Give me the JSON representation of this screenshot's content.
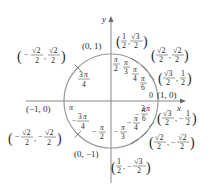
{
  "diagram": {
    "axes": {
      "x_label": "x",
      "y_label": "y"
    },
    "colors": {
      "circle": "#9a9a9a",
      "axes": "#6a6a6a",
      "text": "#2a2a2a"
    },
    "points": [
      {
        "id": "p0",
        "angle_label": "0",
        "alt_label": "2π",
        "coords": "(1, 0)"
      },
      {
        "id": "p30",
        "angle_label": "π/6",
        "coords": "(√3/2, 1/2)"
      },
      {
        "id": "p45",
        "angle_label": "π/4",
        "coords": "(√2/2, √2/2)"
      },
      {
        "id": "p60",
        "angle_label": "π/3",
        "coords": "(1/2, √3/2)"
      },
      {
        "id": "p90",
        "angle_label": "π/2",
        "coords": "(0, 1)"
      },
      {
        "id": "p135",
        "angle_label": "3π/4",
        "coords": "(−√2/2, √2/2)"
      },
      {
        "id": "p180",
        "angle_label": "π",
        "coords": "(−1, 0)"
      },
      {
        "id": "p225",
        "angle_label": "−3π/4",
        "coords": "(−√2/2, −√2/2)"
      },
      {
        "id": "p270",
        "angle_label": "−π/2",
        "coords": "(0, −1)"
      },
      {
        "id": "p300",
        "angle_label": "−π/3",
        "coords": "(1/2, −√3/2)"
      },
      {
        "id": "p315",
        "angle_label": "−π/4",
        "coords": "(√2/2, −√2/2)"
      },
      {
        "id": "p330",
        "angle_label": "−π/6",
        "coords": "(√3/2, −1/2)"
      }
    ],
    "labels": {
      "one_zero": "(1, 0)",
      "zero_one": "(0, 1)",
      "neg_one_zero": "(−1, 0)",
      "zero_neg_one": "(0, −1)",
      "zero": "0",
      "two_pi": "2π",
      "pi": "π",
      "pi_num": "π",
      "three_pi": "3π",
      "den2": "2",
      "den3": "3",
      "den4": "4",
      "den6": "6",
      "minus": "−",
      "sqrt2": "√2",
      "sqrt3": "√3",
      "one": "1",
      "comma": ",",
      "lparen": "(",
      "rparen": ")"
    }
  }
}
